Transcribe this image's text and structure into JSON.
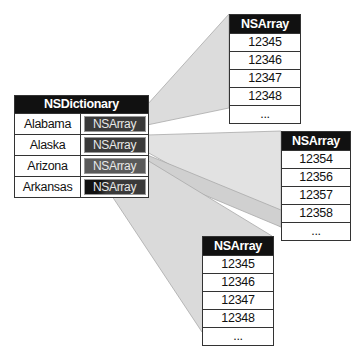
{
  "dictionary": {
    "title": "NSDictionary",
    "entries": [
      {
        "key": "Alabama",
        "value": "NSArray"
      },
      {
        "key": "Alaska",
        "value": "NSArray"
      },
      {
        "key": "Arizona",
        "value": "NSArray"
      },
      {
        "key": "Arkansas",
        "value": "NSArray"
      }
    ]
  },
  "arrays": {
    "top": {
      "title": "NSArray",
      "items": [
        "12345",
        "12346",
        "12347",
        "12348",
        "..."
      ]
    },
    "right": {
      "title": "NSArray",
      "items": [
        "12354",
        "12356",
        "12357",
        "12358",
        "..."
      ]
    },
    "bottom": {
      "title": "NSArray",
      "items": [
        "12345",
        "12346",
        "12347",
        "12348",
        "..."
      ]
    }
  },
  "colors": {
    "header_bg": "#111111",
    "wedge_fill": "#dcdcdc",
    "wedge_stroke": "#999999"
  }
}
